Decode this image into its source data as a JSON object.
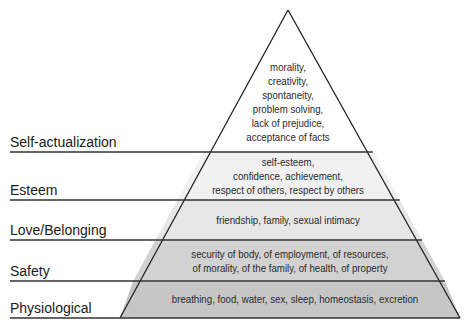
{
  "colors": {
    "self_actualization": "#ffffff",
    "esteem": "#f1f1f1",
    "love_belonging": "#e7e7e7",
    "safety": "#d2d2d2",
    "physiological": "#c6c6c6",
    "lines": "#333333"
  },
  "levels": [
    {
      "name": "Self-actualization",
      "lines": [
        "morality,",
        "creativity,",
        "spontaneity,",
        "problem solving,",
        "lack of prejudice,",
        "acceptance of facts"
      ]
    },
    {
      "name": "Esteem",
      "lines": [
        "self-esteem,",
        "confidence, achievement,",
        "respect of others, respect by others"
      ]
    },
    {
      "name": "Love/Belonging",
      "lines": [
        "friendship, family, sexual intimacy"
      ]
    },
    {
      "name": "Safety",
      "lines": [
        "security of body, of employment, of resources,",
        "of morality, of the family, of health, of property"
      ]
    },
    {
      "name": "Physiological",
      "lines": [
        "breathing, food, water, sex, sleep, homeostasis, excretion"
      ]
    }
  ]
}
